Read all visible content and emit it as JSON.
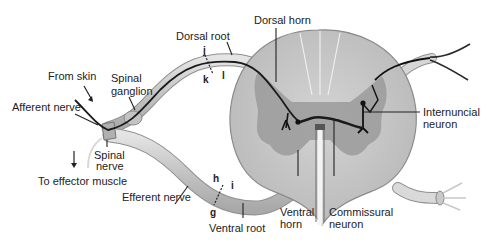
{
  "figure": {
    "labels": {
      "dorsal_horn": "Dorsal horn",
      "dorsal_root": "Dorsal root",
      "from_skin": "From skin",
      "spinal_ganglion_1": "Spinal",
      "spinal_ganglion_2": "ganglion",
      "afferent_nerve": "Afferent nerve",
      "spinal_nerve_1": "Spinal",
      "spinal_nerve_2": "nerve",
      "to_effector": "To effector muscle",
      "efferent_nerve": "Efferent nerve",
      "ventral_root": "Ventral root",
      "ventral_horn_1": "Ventral",
      "ventral_horn_2": "horn",
      "commissural_1": "Commissural",
      "commissural_2": "neuron",
      "internuncial_1": "Internuncial",
      "internuncial_2": "neuron",
      "letter_j": "j",
      "letter_k": "k",
      "letter_l": "l",
      "letter_h": "h",
      "letter_i": "i",
      "letter_g": "g"
    },
    "colors": {
      "white_matter": "#c9c9c9",
      "gray_matter": "#9a9a9a",
      "nerve_fill": "#cfcfcf",
      "nerve_edge": "#8a8a8a",
      "neuron": "#1a1a1a",
      "leader": "#222222"
    }
  }
}
